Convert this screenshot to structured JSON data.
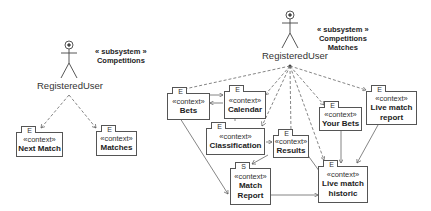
{
  "left_diagram": {
    "actor": {
      "label": "RegisteredUser"
    },
    "subsystem": {
      "stereotype": "« subsystem »",
      "name": "Competitions"
    },
    "contexts": [
      {
        "tab": "E",
        "stereotype": "«context»",
        "name": "Next Match"
      },
      {
        "tab": "E",
        "stereotype": "«context»",
        "name": "Matches"
      }
    ]
  },
  "right_diagram": {
    "actor": {
      "label": "RegisteredUser"
    },
    "subsystem": {
      "stereotype": "« subsystem »",
      "name_line1": "Competitions",
      "name_line2": "Matches"
    },
    "contexts": [
      {
        "tab": "E",
        "stereotype": "«context»",
        "name": "Bets"
      },
      {
        "tab": "E",
        "stereotype": "«context»",
        "name": "Calendar"
      },
      {
        "tab": "E",
        "stereotype": "«context»",
        "name": "Classification"
      },
      {
        "tab": "E",
        "stereotype": "«context»",
        "name": "Results"
      },
      {
        "tab": "E",
        "stereotype": "«context»",
        "name": "Your Bets"
      },
      {
        "tab": "E",
        "stereotype": "«context»",
        "name_line1": "Live match",
        "name_line2": "report"
      },
      {
        "tab": "S",
        "stereotype": "«context»",
        "name_line1": "Match",
        "name_line2": "Report"
      },
      {
        "tab": "E",
        "stereotype": "«context»",
        "name_line1": "Live match",
        "name_line2": "historic"
      }
    ]
  }
}
